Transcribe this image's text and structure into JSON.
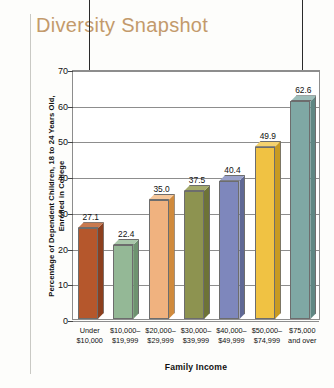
{
  "title": "Diversity Snapshot",
  "axis_title_color": "#c39a6b",
  "chart_data": {
    "type": "bar",
    "title": "Diversity Snapshot",
    "xlabel": "Family Income",
    "ylabel": "Percentage of Dependent Children, 18 to 24 Years Old, Enrolled in College",
    "ylabel_line1": "Percentage of Dependent Children, 18 to 24 Years Old,",
    "ylabel_line2": "Enrolled in College",
    "categories": [
      "Under $10,000",
      "$10,000–$19,999",
      "$20,000–$29,999",
      "$30,000–$39,999",
      "$40,000–$49,999",
      "$50,000–$74,999",
      "$75,000 and over"
    ],
    "category_lines": [
      [
        "Under",
        "$10,000"
      ],
      [
        "$10,000–",
        "$19,999"
      ],
      [
        "$20,000–",
        "$29,999"
      ],
      [
        "$30,000–",
        "$39,999"
      ],
      [
        "$40,000–",
        "$49,999"
      ],
      [
        "$50,000–",
        "$74,999"
      ],
      [
        "$75,000",
        "and over"
      ]
    ],
    "values": [
      27.1,
      22.4,
      35.0,
      37.5,
      40.4,
      49.9,
      62.6
    ],
    "value_labels": [
      "27.1",
      "22.4",
      "35.0",
      "37.5",
      "40.4",
      "49.9",
      "62.6"
    ],
    "colors": [
      "#b5572c",
      "#94b896",
      "#f0b27f",
      "#8d9350",
      "#7e87bc",
      "#f0c243",
      "#7fa8a4"
    ],
    "side_colors": [
      "#8c3f1e",
      "#6e9370",
      "#d08a3c",
      "#6d7337",
      "#5f6895",
      "#c79a22",
      "#5f8783"
    ],
    "top_colors": [
      "#c97a50",
      "#a9c7aa",
      "#f5c79c",
      "#a3a96a",
      "#99a0ca",
      "#f5d26e",
      "#9dbdb9"
    ],
    "ylim": [
      0,
      70
    ],
    "yticks": [
      0,
      10,
      20,
      30,
      40,
      50,
      60,
      70
    ],
    "ytick_labels": [
      "0",
      "10",
      "20",
      "30",
      "40",
      "50",
      "60",
      "70"
    ],
    "grid": true,
    "legend": false,
    "annotations": [
      {
        "name": "lowest-value-arrow",
        "target": "22.4",
        "points_to_bar_index": 0,
        "direction": "down"
      },
      {
        "name": "highest-value-arrow",
        "target": "62.6",
        "points_to_bar_index": 6,
        "direction": "down"
      }
    ]
  }
}
